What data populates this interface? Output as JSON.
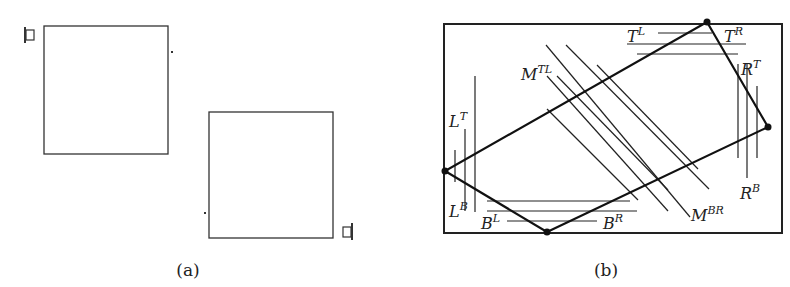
{
  "panel_a": {
    "caption": "(a)"
  },
  "panel_b": {
    "caption": "(b)",
    "labels": {
      "T_L": {
        "base": "T",
        "sup": "L"
      },
      "T_R": {
        "base": "T",
        "sup": "R"
      },
      "R_T": {
        "base": "R",
        "sup": "T"
      },
      "R_B": {
        "base": "R",
        "sup": "B"
      },
      "L_T": {
        "base": "L",
        "sup": "T"
      },
      "L_B": {
        "base": "L",
        "sup": "B"
      },
      "B_L": {
        "base": "B",
        "sup": "L"
      },
      "B_R": {
        "base": "B",
        "sup": "R"
      },
      "M_TL": {
        "base": "M",
        "sup": "TL"
      },
      "M_BR": {
        "base": "M",
        "sup": "BR"
      }
    }
  }
}
